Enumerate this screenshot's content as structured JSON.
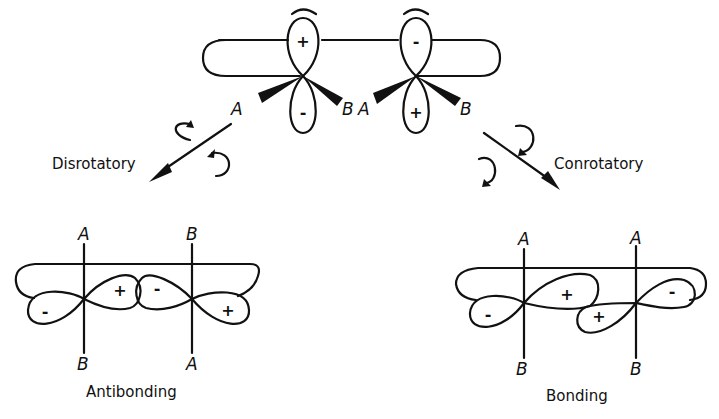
{
  "diagram": {
    "top": {
      "left_carbon": {
        "upper_lobe_sign": "+",
        "lower_lobe_sign": "-",
        "substituent_left": "A",
        "substituent_right": "B"
      },
      "right_carbon": {
        "upper_lobe_sign": "-",
        "lower_lobe_sign": "+",
        "substituent_left": "A",
        "substituent_right": "B"
      }
    },
    "arrows": {
      "left": {
        "label": "Disrotatory"
      },
      "right": {
        "label": "Conrotatory"
      }
    },
    "bottom_left": {
      "caption": "Antibonding",
      "left_axis": {
        "top": "A",
        "bottom": "B"
      },
      "right_axis": {
        "top": "B",
        "bottom": "A"
      },
      "signs": {
        "far_left": "-",
        "inner_left": "+",
        "inner_right": "-",
        "far_right": "+"
      }
    },
    "bottom_right": {
      "caption": "Bonding",
      "left_axis": {
        "top": "A",
        "bottom": "B"
      },
      "right_axis": {
        "top": "A",
        "bottom": "B"
      },
      "signs": {
        "far_left": "-",
        "inner_left": "+",
        "inner_right": "+",
        "far_right": "-"
      }
    }
  }
}
